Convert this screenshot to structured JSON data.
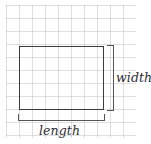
{
  "figure": {
    "type": "geometry-diagram",
    "background_color": "#ffffff",
    "grid": {
      "line_color": "#96969b",
      "cell_size_px": 13,
      "columns": 10,
      "rows": 10
    },
    "shape": {
      "name": "rectangle",
      "stroke_color": "#3b3b3f",
      "fill": "none",
      "width_cells": 6.5,
      "height_cells": 5
    },
    "brackets": {
      "color": "#55555a",
      "vertical": {
        "position": "right",
        "label_ref": "width"
      },
      "horizontal": {
        "position": "bottom",
        "label_ref": "length"
      }
    },
    "labels": {
      "width": "width",
      "length": "length",
      "style": "italic"
    }
  }
}
